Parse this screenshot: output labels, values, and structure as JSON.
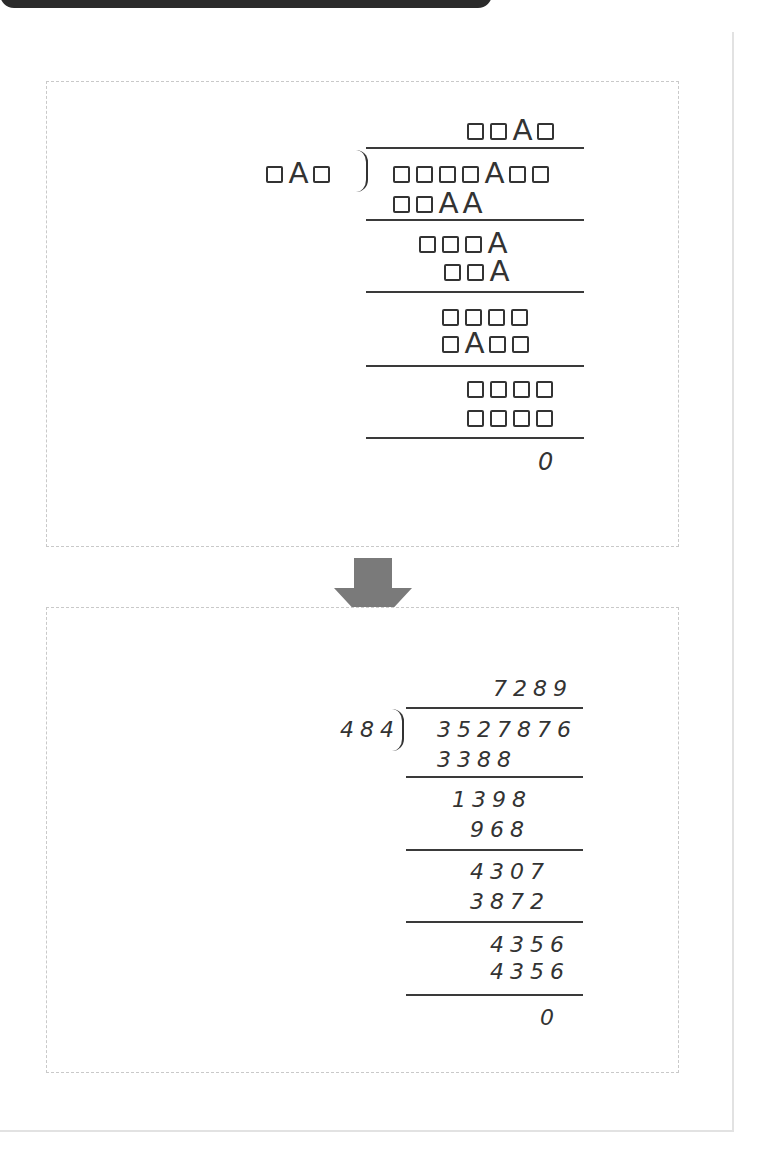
{
  "puzzle": {
    "quotient": "□□A□",
    "divisor": "□A□",
    "dividend": "□□□□A□□",
    "steps": [
      {
        "subtrahend": "□□AA"
      },
      {
        "remainder": "□□□A",
        "subtrahend": "□□A"
      },
      {
        "remainder": "□□□□",
        "subtrahend": "□A□□"
      },
      {
        "remainder": "□□□□",
        "subtrahend": "□□□□"
      }
    ],
    "final_remainder": "0"
  },
  "solution": {
    "quotient": "7289",
    "divisor": "484",
    "dividend": "3527876",
    "steps": [
      {
        "subtrahend": "3388"
      },
      {
        "remainder": "1398",
        "subtrahend": "968"
      },
      {
        "remainder": "4307",
        "subtrahend": "3872"
      },
      {
        "remainder": "4356",
        "subtrahend": "4356"
      }
    ],
    "final_remainder": "0"
  },
  "arrow": {
    "icon": "down-arrow-icon",
    "color": "#7a7a7a"
  },
  "colors": {
    "ink": "#333333",
    "panel_border": "#c9c9c9",
    "top_bar": "#2b2b2b"
  }
}
